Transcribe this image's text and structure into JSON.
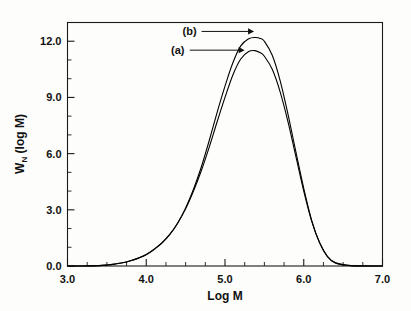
{
  "chart_data": {
    "type": "line",
    "title": "",
    "subtitle": "",
    "xlabel": "Log M",
    "ylabel_text": "W",
    "ylabel_sub": "N",
    "ylabel_tail": " (log M)",
    "ylabel_full": "W_N (log M)",
    "xlim": [
      3.0,
      7.0
    ],
    "ylim": [
      0.0,
      13.0
    ],
    "grid": false,
    "legend_position": "inline-annotations",
    "xticks": [
      3.0,
      4.0,
      5.0,
      6.0,
      7.0
    ],
    "xtick_labels": [
      "3.0",
      "4.0",
      "5.0",
      "6.0",
      "7.0"
    ],
    "x_minor_step": 0.25,
    "yticks": [
      0.0,
      3.0,
      6.0,
      9.0,
      12.0
    ],
    "ytick_labels": [
      "0.0",
      "3.0",
      "6.0",
      "9.0",
      "12.0"
    ],
    "y_minor_step": 1.0,
    "annotations": [
      {
        "name": "curve-b-callout",
        "label": "(b)",
        "target_x": 5.42,
        "target_y": 12.2,
        "label_x": 4.55,
        "label_y": 12.55
      },
      {
        "name": "curve-a-callout",
        "label": "(a)",
        "target_x": 5.3,
        "target_y": 11.5,
        "label_x": 4.4,
        "label_y": 11.55
      }
    ],
    "series": [
      {
        "name": "(a)",
        "peak_x": 5.38,
        "peak_y": 11.5,
        "color": "#000000",
        "x": [
          3.0,
          3.2,
          3.4,
          3.5,
          3.6,
          3.7,
          3.8,
          3.9,
          4.0,
          4.1,
          4.2,
          4.3,
          4.4,
          4.5,
          4.6,
          4.7,
          4.8,
          4.9,
          5.0,
          5.1,
          5.2,
          5.3,
          5.38,
          5.45,
          5.5,
          5.6,
          5.7,
          5.8,
          5.9,
          6.0,
          6.1,
          6.2,
          6.3,
          6.4,
          6.6,
          7.0
        ],
        "values": [
          0.0,
          0.0,
          0.02,
          0.05,
          0.1,
          0.17,
          0.28,
          0.42,
          0.62,
          0.9,
          1.25,
          1.7,
          2.3,
          3.05,
          4.0,
          5.1,
          6.35,
          7.7,
          9.0,
          10.2,
          11.05,
          11.45,
          11.5,
          11.38,
          11.2,
          10.5,
          9.3,
          7.7,
          5.85,
          4.0,
          2.4,
          1.25,
          0.52,
          0.18,
          0.02,
          0.0
        ]
      },
      {
        "name": "(b)",
        "peak_x": 5.44,
        "peak_y": 12.2,
        "color": "#000000",
        "x": [
          3.0,
          3.2,
          3.4,
          3.5,
          3.6,
          3.7,
          3.8,
          3.9,
          4.0,
          4.1,
          4.2,
          4.3,
          4.4,
          4.5,
          4.6,
          4.7,
          4.8,
          4.9,
          5.0,
          5.1,
          5.2,
          5.3,
          5.38,
          5.45,
          5.5,
          5.6,
          5.7,
          5.8,
          5.9,
          6.0,
          6.1,
          6.2,
          6.3,
          6.4,
          6.6,
          7.0
        ],
        "values": [
          0.0,
          0.0,
          0.02,
          0.05,
          0.1,
          0.17,
          0.28,
          0.42,
          0.6,
          0.88,
          1.22,
          1.68,
          2.3,
          3.1,
          4.1,
          5.3,
          6.7,
          8.2,
          9.6,
          10.85,
          11.75,
          12.13,
          12.2,
          12.15,
          12.0,
          11.25,
          9.9,
          8.1,
          6.1,
          4.15,
          2.45,
          1.25,
          0.5,
          0.16,
          0.02,
          0.0
        ]
      }
    ]
  },
  "figure": {
    "background_color": "#fdfdfb",
    "axis_color": "#1a1a1a",
    "curve_color": "#000000"
  }
}
